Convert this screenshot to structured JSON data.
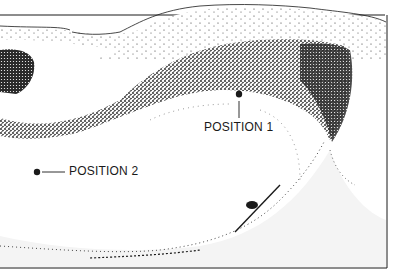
{
  "diagram": {
    "type": "stippled-illustration",
    "labels": {
      "position_1": "POSITION 1",
      "position_2": "POSITION 2"
    },
    "markers": [
      {
        "id": "position_1",
        "x": 239,
        "y": 94,
        "leader": "vertical-down"
      },
      {
        "id": "position_2",
        "x": 37,
        "y": 172,
        "leader": "horizontal-right"
      }
    ],
    "colors": {
      "ink": "#1a1a1a",
      "paper": "#ffffff",
      "light_shade": "#f2f2f2"
    }
  }
}
